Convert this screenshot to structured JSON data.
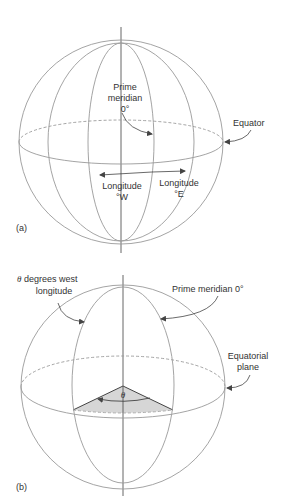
{
  "figure_a": {
    "panel_label": "(a)",
    "prime_meridian": {
      "line1": "Prime",
      "line2": "meridian",
      "line3": "0°"
    },
    "equator_label": "Equator",
    "longitude_west": {
      "line1": "Longitude",
      "line2": "°W"
    },
    "longitude_east": {
      "line1": "Longitude",
      "line2": "°E"
    }
  },
  "figure_b": {
    "panel_label": "(b)",
    "west_longitude": {
      "symbol": "θ",
      "line1_rest": " degrees west",
      "line2": "longitude"
    },
    "prime_meridian_label": "Prime meridian 0°",
    "equatorial_plane": {
      "line1": "Equatorial",
      "line2": "plane"
    },
    "angle_symbol": "θ"
  },
  "colors": {
    "line": "#9a9a9a",
    "axis": "#555555",
    "arrow": "#444444",
    "wedge_fill": "#d6d6d6",
    "text": "#333333"
  }
}
